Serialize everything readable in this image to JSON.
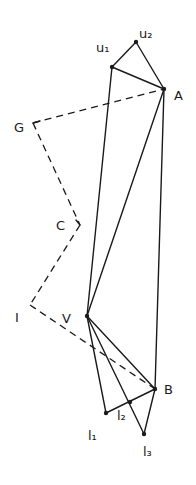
{
  "diagram": {
    "type": "hand-drawn geometric construction",
    "points": {
      "u1": {
        "label": "u1",
        "x": 112,
        "y": 67
      },
      "u2": {
        "label": "u2",
        "x": 136,
        "y": 42
      },
      "A": {
        "label": "A",
        "x": 164,
        "y": 89
      },
      "G": {
        "label": "G",
        "x": 33,
        "y": 123
      },
      "C": {
        "label": "C",
        "x": 80,
        "y": 225
      },
      "I": {
        "label": "I",
        "x": 30,
        "y": 305
      },
      "V": {
        "label": "V",
        "x": 87,
        "y": 316
      },
      "B": {
        "label": "B",
        "x": 155,
        "y": 389
      },
      "l1": {
        "label": "l1",
        "x": 106,
        "y": 413
      },
      "l2": {
        "label": "l2",
        "x": 130,
        "y": 402
      },
      "l3": {
        "label": "l3",
        "x": 144,
        "y": 434
      }
    },
    "labels": {
      "u1": "u₁",
      "u2": "u₂",
      "A": "A",
      "G": "G",
      "C": "C",
      "I": "I",
      "V": "V",
      "B": "B",
      "l1": "l₁",
      "l2": "l₂",
      "l3": "l₃"
    },
    "solid_edges": [
      [
        "u1",
        "u2"
      ],
      [
        "u2",
        "A"
      ],
      [
        "u1",
        "A"
      ],
      [
        "u1",
        "V"
      ],
      [
        "A",
        "V"
      ],
      [
        "A",
        "B"
      ],
      [
        "V",
        "B"
      ],
      [
        "V",
        "l1"
      ],
      [
        "V",
        "l3"
      ],
      [
        "l1",
        "B"
      ],
      [
        "B",
        "l3"
      ]
    ],
    "dashed_edges": [
      [
        "G",
        "A"
      ],
      [
        "G",
        "C"
      ],
      [
        "C",
        "I"
      ],
      [
        "I",
        "B"
      ]
    ],
    "colors": {
      "ink": "#1a1a1a",
      "background": "#ffffff"
    }
  }
}
